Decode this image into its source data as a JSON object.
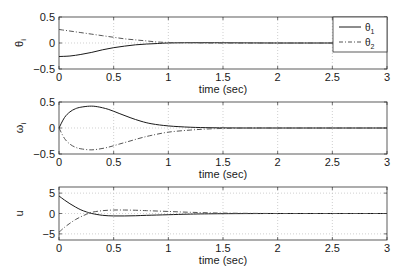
{
  "chart_data": [
    {
      "type": "line",
      "title": "",
      "xlabel": "time (sec)",
      "ylabel": "θi",
      "ylabel_sub": "i",
      "xlim": [
        0,
        3
      ],
      "ylim": [
        -0.5,
        0.5
      ],
      "xticks": [
        0,
        0.5,
        1,
        1.5,
        2,
        2.5,
        3
      ],
      "xtick_labels": [
        "0",
        "0.5",
        "1",
        "1.5",
        "2",
        "2.5",
        "3"
      ],
      "yticks": [
        -0.5,
        0,
        0.5
      ],
      "ytick_labels": [
        "−0.5",
        "0",
        "0.5"
      ],
      "grid": true,
      "legend": {
        "position": "upper right",
        "entries": [
          {
            "label": "θ",
            "sub": "1",
            "style": "solid"
          },
          {
            "label": "θ",
            "sub": "2",
            "style": "dashdot"
          }
        ]
      },
      "x": [
        0,
        0.1,
        0.2,
        0.3,
        0.4,
        0.5,
        0.6,
        0.7,
        0.8,
        0.9,
        1.0,
        1.2,
        1.4,
        1.6,
        2.0,
        2.5,
        3.0
      ],
      "series": [
        {
          "name": "θ1",
          "style": "solid",
          "values": [
            -0.26,
            -0.25,
            -0.22,
            -0.18,
            -0.13,
            -0.09,
            -0.06,
            -0.035,
            -0.02,
            -0.01,
            0.0,
            0.005,
            0.005,
            0.003,
            0.0,
            0.0,
            0.0
          ]
        },
        {
          "name": "θ2",
          "style": "dashdot",
          "values": [
            0.26,
            0.23,
            0.2,
            0.17,
            0.14,
            0.11,
            0.08,
            0.06,
            0.04,
            0.02,
            0.01,
            0.005,
            0.0,
            0.0,
            0.0,
            0.0,
            0.0
          ]
        }
      ]
    },
    {
      "type": "line",
      "title": "",
      "xlabel": "time (sec)",
      "ylabel": "ωi",
      "ylabel_sub": "i",
      "xlim": [
        0,
        3
      ],
      "ylim": [
        -0.5,
        0.5
      ],
      "xticks": [
        0,
        0.5,
        1,
        1.5,
        2,
        2.5,
        3
      ],
      "xtick_labels": [
        "0",
        "0.5",
        "1",
        "1.5",
        "2",
        "2.5",
        "3"
      ],
      "yticks": [
        -0.5,
        0,
        0.5
      ],
      "ytick_labels": [
        "−0.5",
        "0",
        "0.5"
      ],
      "grid": true,
      "x": [
        0,
        0.05,
        0.1,
        0.15,
        0.2,
        0.28,
        0.35,
        0.45,
        0.55,
        0.65,
        0.75,
        0.85,
        1.0,
        1.2,
        1.4,
        1.7,
        2.0,
        2.5,
        3.0
      ],
      "series": [
        {
          "name": "ω1",
          "style": "solid",
          "values": [
            0.0,
            0.2,
            0.31,
            0.37,
            0.4,
            0.42,
            0.41,
            0.36,
            0.28,
            0.2,
            0.13,
            0.08,
            0.04,
            0.015,
            0.005,
            0.0,
            0.0,
            0.0,
            0.0
          ]
        },
        {
          "name": "ω2",
          "style": "dashdot",
          "values": [
            0.0,
            -0.2,
            -0.31,
            -0.37,
            -0.4,
            -0.42,
            -0.41,
            -0.37,
            -0.31,
            -0.25,
            -0.19,
            -0.14,
            -0.08,
            -0.04,
            -0.015,
            0.0,
            0.0,
            0.0,
            0.0
          ]
        }
      ]
    },
    {
      "type": "line",
      "title": "",
      "xlabel": "time (sec)",
      "ylabel": "u",
      "xlim": [
        0,
        3
      ],
      "ylim": [
        -6.5,
        6.5
      ],
      "xticks": [
        0,
        0.5,
        1,
        1.5,
        2,
        2.5,
        3
      ],
      "xtick_labels": [
        "0",
        "0.5",
        "1",
        "1.5",
        "2",
        "2.5",
        "3"
      ],
      "yticks": [
        -5,
        0,
        5
      ],
      "ytick_labels": [
        "−5",
        "0",
        "5"
      ],
      "grid": true,
      "x": [
        0,
        0.05,
        0.1,
        0.15,
        0.2,
        0.25,
        0.3,
        0.4,
        0.5,
        0.6,
        0.7,
        0.8,
        1.0,
        1.2,
        1.5,
        2.0,
        2.5,
        3.0
      ],
      "series": [
        {
          "name": "u1",
          "style": "solid",
          "values": [
            4.3,
            3.3,
            2.4,
            1.6,
            0.9,
            0.4,
            0.0,
            -0.45,
            -0.6,
            -0.6,
            -0.55,
            -0.45,
            -0.3,
            -0.15,
            -0.05,
            0.0,
            0.0,
            0.0
          ]
        },
        {
          "name": "u2",
          "style": "dashdot",
          "values": [
            -4.6,
            -3.4,
            -2.4,
            -1.5,
            -0.8,
            -0.2,
            0.3,
            0.7,
            0.85,
            0.85,
            0.8,
            0.7,
            0.5,
            0.3,
            0.1,
            0.0,
            0.0,
            0.0
          ]
        }
      ]
    }
  ],
  "layout": {
    "plot_left": 59,
    "plot_right": 387,
    "panels": [
      {
        "top": 17,
        "bottom": 69
      },
      {
        "top": 102,
        "bottom": 154
      },
      {
        "top": 187,
        "bottom": 240
      }
    ],
    "colors": {
      "axis": "#333333",
      "solid": "#1a1a1a",
      "dash": "#555555",
      "grid": "#bbbbbb"
    }
  }
}
